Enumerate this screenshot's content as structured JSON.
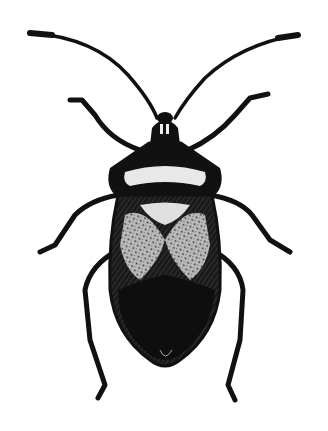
{
  "image": {
    "subject": "insect-illustration",
    "description": "Black and white engraving of a true bug (Hemiptera) viewed from above",
    "colors": {
      "background": "#ffffff",
      "ink": "#111111",
      "highlight": "#e8e8e8"
    }
  }
}
